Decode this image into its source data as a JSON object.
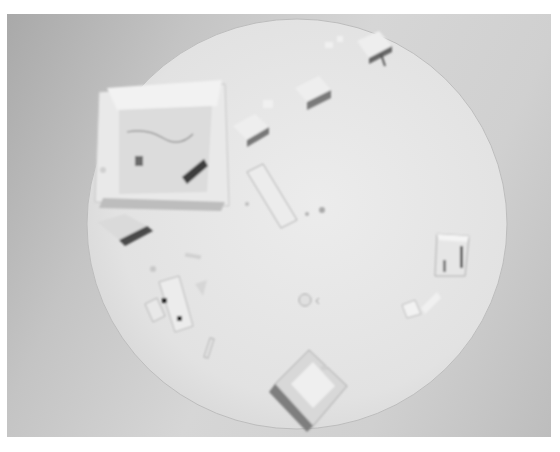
{
  "image": {
    "description": "Grayscale photograph of a white architectural massing model on a circular base, viewed from above",
    "colors": {
      "border": "#ffffff",
      "background_dark": "#a9a9a9",
      "background_light": "#d6d6d6",
      "base_disc": "#e6e6e6",
      "block_top": "#ececec",
      "block_shadow": "#555555"
    },
    "objects": [
      {
        "name": "large-open-box",
        "position": "upper-left"
      },
      {
        "name": "block-row",
        "count": 4,
        "position": "top arc"
      },
      {
        "name": "flat-slab",
        "position": "center"
      },
      {
        "name": "small-left-block",
        "position": "left"
      },
      {
        "name": "pale-cluster-with-dots",
        "position": "lower-left"
      },
      {
        "name": "right-box-building",
        "position": "right"
      },
      {
        "name": "small-blocks-right",
        "position": "lower-right"
      },
      {
        "name": "bottom-open-box",
        "position": "bottom"
      },
      {
        "name": "round-marker",
        "position": "center"
      }
    ]
  }
}
